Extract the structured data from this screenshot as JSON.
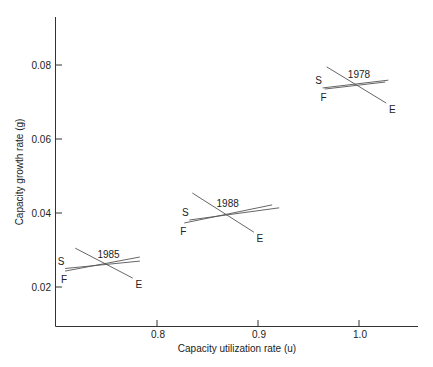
{
  "chart_data": {
    "type": "scatter",
    "title": "",
    "xlabel": "Capacity utilization rate (u)",
    "ylabel": "Capacity growth rate (g)",
    "xlim": [
      0.7,
      1.06
    ],
    "ylim": [
      0.0095,
      0.093
    ],
    "grid": false,
    "legend": "none",
    "x_ticks": [
      0.8,
      0.9,
      1.0
    ],
    "x_tick_labels": [
      "0.8",
      "0.9",
      "1.0"
    ],
    "y_ticks": [
      0.02,
      0.04,
      0.06,
      0.08
    ],
    "y_tick_labels": [
      "0.02",
      "0.04",
      "0.06",
      "0.08"
    ],
    "curve_labels": {
      "S": "S",
      "F": "F",
      "E": "E"
    },
    "series": [
      {
        "name": "1985",
        "equilibrium": {
          "u": 0.75,
          "g": 0.026
        },
        "lines": {
          "E": [
            [
              0.719,
              0.0305
            ],
            [
              0.776,
              0.0224
            ]
          ],
          "S": [
            [
              0.709,
              0.025
            ],
            [
              0.783,
              0.027
            ]
          ],
          "F": [
            [
              0.709,
              0.0243
            ],
            [
              0.783,
              0.0281
            ]
          ]
        }
      },
      {
        "name": "1988",
        "equilibrium": {
          "u": 0.868,
          "g": 0.0397
        },
        "lines": {
          "E": [
            [
              0.835,
              0.0454
            ],
            [
              0.896,
              0.0348
            ]
          ],
          "S": [
            [
              0.832,
              0.0381
            ],
            [
              0.921,
              0.0414
            ]
          ],
          "F": [
            [
              0.827,
              0.0373
            ],
            [
              0.914,
              0.0422
            ]
          ]
        }
      },
      {
        "name": "1978",
        "equilibrium": {
          "u": 0.998,
          "g": 0.0746
        },
        "lines": {
          "E": [
            [
              0.968,
              0.0795
            ],
            [
              1.027,
              0.0697
            ]
          ],
          "S": [
            [
              0.964,
              0.0738
            ],
            [
              1.029,
              0.0759
            ]
          ],
          "F": [
            [
              0.966,
              0.0735
            ],
            [
              1.026,
              0.0754
            ]
          ]
        }
      }
    ]
  }
}
